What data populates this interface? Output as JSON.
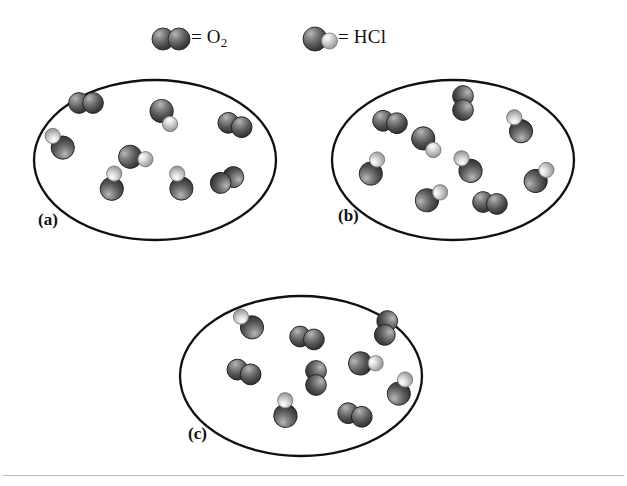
{
  "figure": {
    "width": 627,
    "height": 486,
    "background_color": "#ffffff",
    "outline_color": "#111111",
    "divider": {
      "y": 475,
      "color": "#b9bbbd"
    }
  },
  "legend": {
    "items": [
      {
        "icon_name": "o2-molecule-icon",
        "equals": "=",
        "formula_main": "O",
        "formula_sub": "2",
        "label": "= O2",
        "x": 153,
        "y": 28,
        "molecule_type": "O2"
      },
      {
        "icon_name": "hcl-molecule-icon",
        "equals": "=",
        "formula_main": "HCl",
        "formula_sub": "",
        "label": "= HCl",
        "x": 300,
        "y": 28,
        "molecule_type": "HCl"
      }
    ]
  },
  "colors": {
    "oxygen_dark": "#4a4a4a",
    "oxygen_highlight": "#c8c8c8",
    "chlorine_dark": "#555555",
    "chlorine_highlight": "#d2d2d2",
    "hydrogen_light": "#cfcfcf",
    "hydrogen_highlight": "#f4f4f4",
    "outline": "#111111"
  },
  "panels": [
    {
      "id": "a",
      "label": "(a)",
      "ellipse": {
        "x": 34,
        "y": 80,
        "w": 242,
        "h": 160
      },
      "label_pos": {
        "x": 38,
        "y": 210
      },
      "molecules": [
        {
          "type": "O2",
          "x": 86,
          "y": 103,
          "r": 0
        },
        {
          "type": "HCl",
          "x": 60,
          "y": 145,
          "r": 200
        },
        {
          "type": "HCl",
          "x": 164,
          "y": 114,
          "r": 28
        },
        {
          "type": "O2",
          "x": 235,
          "y": 125,
          "r": 18
        },
        {
          "type": "HCl",
          "x": 134,
          "y": 157,
          "r": 340
        },
        {
          "type": "HCl",
          "x": 112,
          "y": 185,
          "r": 250
        },
        {
          "type": "HCl",
          "x": 180,
          "y": 185,
          "r": 225
        },
        {
          "type": "O2",
          "x": 227,
          "y": 180,
          "r": 155
        }
      ]
    },
    {
      "id": "b",
      "label": "(b)",
      "ellipse": {
        "x": 332,
        "y": 80,
        "w": 242,
        "h": 160
      },
      "label_pos": {
        "x": 338,
        "y": 206
      },
      "molecules": [
        {
          "type": "O2",
          "x": 390,
          "y": 122,
          "r": 10
        },
        {
          "type": "O2",
          "x": 463,
          "y": 103,
          "r": 90
        },
        {
          "type": "HCl",
          "x": 426,
          "y": 141,
          "r": 20
        },
        {
          "type": "HCl",
          "x": 519,
          "y": 128,
          "r": 215
        },
        {
          "type": "HCl",
          "x": 372,
          "y": 170,
          "r": 265
        },
        {
          "type": "HCl",
          "x": 468,
          "y": 168,
          "r": 205
        },
        {
          "type": "HCl",
          "x": 538,
          "y": 178,
          "r": 285
        },
        {
          "type": "HCl",
          "x": 430,
          "y": 198,
          "r": 300
        },
        {
          "type": "O2",
          "x": 490,
          "y": 203,
          "r": 8
        }
      ]
    },
    {
      "id": "c",
      "label": "(c)",
      "ellipse": {
        "x": 180,
        "y": 296,
        "w": 242,
        "h": 160
      },
      "label_pos": {
        "x": 188,
        "y": 424
      },
      "molecules": [
        {
          "type": "HCl",
          "x": 249,
          "y": 325,
          "r": 195
        },
        {
          "type": "O2",
          "x": 307,
          "y": 338,
          "r": 12
        },
        {
          "type": "O2",
          "x": 386,
          "y": 328,
          "r": 100
        },
        {
          "type": "O2",
          "x": 244,
          "y": 372,
          "r": 20
        },
        {
          "type": "O2",
          "x": 316,
          "y": 378,
          "r": 90
        },
        {
          "type": "HCl",
          "x": 364,
          "y": 363,
          "r": 330
        },
        {
          "type": "HCl",
          "x": 400,
          "y": 390,
          "r": 265
        },
        {
          "type": "HCl",
          "x": 285,
          "y": 412,
          "r": 240
        },
        {
          "type": "O2",
          "x": 355,
          "y": 415,
          "r": 15
        }
      ]
    }
  ]
}
